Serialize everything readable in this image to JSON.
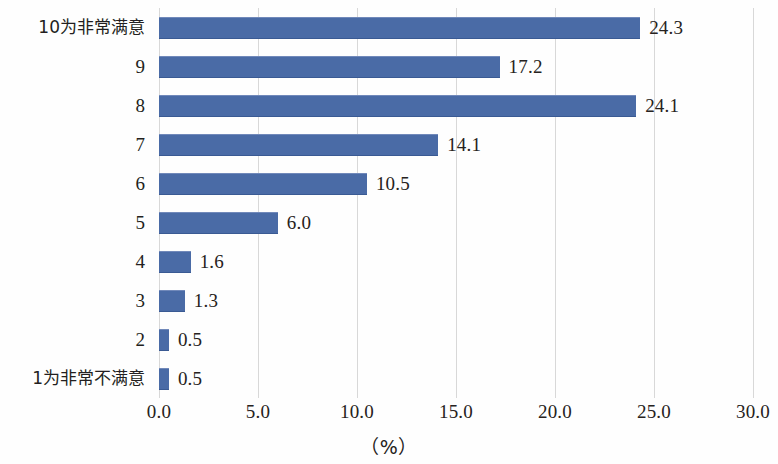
{
  "chart_data": {
    "type": "bar",
    "orientation": "horizontal",
    "title": "",
    "subtitle": "",
    "xlabel": "（%）",
    "ylabel": "",
    "xlim": [
      0.0,
      30.0
    ],
    "xticks": [
      "0.0",
      "5.0",
      "10.0",
      "15.0",
      "20.0",
      "25.0",
      "30.0"
    ],
    "xtick_values": [
      0,
      5,
      10,
      15,
      20,
      25,
      30
    ],
    "grid": true,
    "grid_axis": "x",
    "legend": false,
    "categories": [
      "10为非常满意",
      "9",
      "8",
      "7",
      "6",
      "5",
      "4",
      "3",
      "2",
      "1为非常不满意"
    ],
    "values": [
      24.3,
      17.2,
      24.1,
      14.1,
      10.5,
      6.0,
      1.6,
      1.3,
      0.5,
      0.5
    ],
    "value_labels": [
      "24.3",
      "17.2",
      "24.1",
      "14.1",
      "10.5",
      "6.0",
      "1.6",
      "1.3",
      "0.5",
      "0.5"
    ],
    "bar_color": "#4a6ba6",
    "grid_color": "#d8d8d8",
    "background_color": "#fefefe",
    "text_color": "#231f20"
  }
}
